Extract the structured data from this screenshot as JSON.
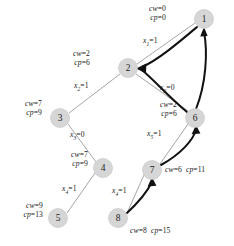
{
  "diagram": {
    "node_fill": "#d6d6d6",
    "tree_edge_color": "#8e8e8e",
    "arc_edge_color": "#111111",
    "nodes": [
      {
        "id": "1",
        "label": "1",
        "cx": 204,
        "cy": 19,
        "r": 9.5
      },
      {
        "id": "2",
        "label": "2",
        "cx": 128,
        "cy": 68,
        "r": 9.5
      },
      {
        "id": "3",
        "label": "3",
        "cx": 60,
        "cy": 118,
        "r": 9.5
      },
      {
        "id": "4",
        "label": "4",
        "cx": 103,
        "cy": 168,
        "r": 9.5
      },
      {
        "id": "5",
        "label": "5",
        "cx": 58,
        "cy": 218,
        "r": 9.5
      },
      {
        "id": "6",
        "label": "6",
        "cx": 195,
        "cy": 118,
        "r": 9.5
      },
      {
        "id": "7",
        "label": "7",
        "cx": 152,
        "cy": 170,
        "r": 9.5
      },
      {
        "id": "8",
        "label": "8",
        "cx": 118,
        "cy": 218,
        "r": 9.5
      }
    ],
    "cost_labels": [
      {
        "node": "1",
        "cw": "cw=0",
        "cp": "cp=0",
        "x": 148,
        "y": 6,
        "align": "right"
      },
      {
        "node": "2",
        "cw": "cw=2",
        "cp": "cp=6",
        "x": 72,
        "y": 51,
        "align": "right"
      },
      {
        "node": "3",
        "cw": "cw=7",
        "cp": "cp=9",
        "x": 4,
        "y": 101,
        "align": "right"
      },
      {
        "node": "4",
        "cw": "cw=7",
        "cp": "cp=9",
        "x": 50,
        "y": 152,
        "align": "right"
      },
      {
        "node": "5",
        "cw": "cw=9",
        "cp": "cp=13",
        "x": 2,
        "y": 203,
        "align": "right"
      },
      {
        "node": "6",
        "cw": "cw=2",
        "cp": "cp=6",
        "x": 139,
        "y": 102,
        "align": "right"
      }
    ],
    "inline_cost_labels": [
      {
        "node": "7",
        "text": "cw=6  cp=11",
        "x": 166,
        "y": 171
      },
      {
        "node": "8",
        "text": "cw=8  cp=15",
        "x": 131,
        "y": 228
      }
    ],
    "edge_labels": [
      {
        "var": "x",
        "sub": "1",
        "value": "=1",
        "x": 144,
        "y": 42
      },
      {
        "var": "x",
        "sub": "2",
        "value": "=1",
        "x": 76,
        "y": 86
      },
      {
        "var": "x",
        "sub": "2",
        "value": "=0",
        "x": 162,
        "y": 88
      },
      {
        "var": "x",
        "sub": "3",
        "value": "=0",
        "x": 72,
        "y": 135
      },
      {
        "var": "x",
        "sub": "4",
        "value": "=1",
        "x": 66,
        "y": 188
      },
      {
        "var": "x",
        "sub": "4",
        "value": "=1",
        "x": 116,
        "y": 190
      },
      {
        "var": "x",
        "sub": "5",
        "value": "=1",
        "x": 150,
        "y": 134
      }
    ],
    "tree_edges": [
      {
        "from": "2",
        "to": "1",
        "d": "M 137 64 L 195 23"
      },
      {
        "from": "2",
        "to": "3",
        "d": "M 120 74 L 69 113"
      },
      {
        "from": "2",
        "to": "6",
        "d": "M 136 74 L 188 111"
      },
      {
        "from": "3",
        "to": "4",
        "d": "M 68 124 L 96 162"
      },
      {
        "from": "4",
        "to": "5",
        "d": "M 95 173 L 67 213"
      },
      {
        "from": "6",
        "to": "7",
        "d": "M 188 124 L 160 164"
      },
      {
        "from": "7",
        "to": "8",
        "d": "M 144 175 L 127 213"
      }
    ],
    "arc_edges": [
      {
        "from": "6",
        "to": "1",
        "d": "M 196 108 C 205 82, 207 52, 203 31"
      },
      {
        "from": "6",
        "to": "2",
        "d": "M 187 112 C 168 96, 152 78, 141 70"
      },
      {
        "from": "1",
        "to": "2",
        "d": "M 196 26 C 172 40, 152 58, 141 68"
      },
      {
        "from": "7",
        "to": "6",
        "d": "M 161 164 C 180 152, 192 138, 195 129"
      },
      {
        "from": "8",
        "to": "7",
        "d": "M 127 212 C 140 198, 148 186, 152 181"
      }
    ]
  }
}
